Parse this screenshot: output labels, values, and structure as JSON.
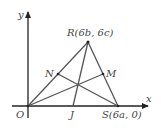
{
  "diagram": {
    "axes": {
      "x_label": "x",
      "y_label": "y"
    },
    "points": {
      "O": {
        "label": "O"
      },
      "R": {
        "label": "R(6b, 6c)"
      },
      "S": {
        "label": "S(6a, 0)"
      },
      "N": {
        "label": "N"
      },
      "M": {
        "label": "M"
      },
      "J": {
        "label": "J"
      }
    },
    "segments": [
      "OR",
      "RS",
      "OS",
      "RJ",
      "SN",
      "OM"
    ],
    "colors": {
      "line": "#555555",
      "axis": "#222222",
      "text": "#444444"
    }
  }
}
